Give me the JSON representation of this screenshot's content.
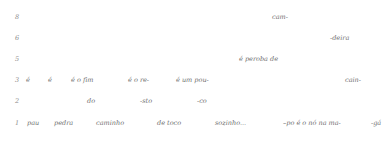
{
  "document": {
    "kind": "syllable-scansion-grid",
    "text_color": "#6f6f6f",
    "number_color": "#8e8e8e",
    "background": "#ffffff"
  },
  "rows": [
    {
      "number": "8",
      "fragments": [
        {
          "text": "cam-",
          "x": 272
        }
      ]
    },
    {
      "number": "6",
      "fragments": [
        {
          "text": "-deira",
          "x": 330
        }
      ]
    },
    {
      "number": "5",
      "fragments": [
        {
          "text": "é peroba de",
          "x": 239
        }
      ]
    },
    {
      "number": "3",
      "fragments": [
        {
          "text": "é",
          "x": 26
        },
        {
          "text": "é",
          "x": 48
        },
        {
          "text": "é o fim",
          "x": 71
        },
        {
          "text": "é o re-",
          "x": 128
        },
        {
          "text": "é um pou-",
          "x": 176
        },
        {
          "text": "cain-",
          "x": 345
        }
      ]
    },
    {
      "number": "2",
      "fragments": [
        {
          "text": "do",
          "x": 87
        },
        {
          "text": "-sto",
          "x": 140
        },
        {
          "text": "-co",
          "x": 197
        }
      ]
    },
    {
      "number": "1",
      "fragments": [
        {
          "text": "pau",
          "x": 27
        },
        {
          "text": "pedra",
          "x": 54
        },
        {
          "text": "caminho",
          "x": 96
        },
        {
          "text": "de toco",
          "x": 157
        },
        {
          "text": "sozinho...",
          "x": 215
        },
        {
          "text": "–po é o nó na ma-",
          "x": 283
        },
        {
          "text": "-gá",
          "x": 371
        }
      ]
    }
  ]
}
